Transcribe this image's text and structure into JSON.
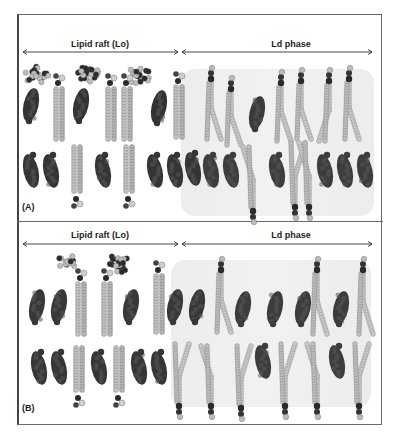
{
  "figure": {
    "panels": [
      {
        "id": "A",
        "tag": "(A)",
        "regions": [
          {
            "label": "Lipid raft (Lo)",
            "x_start": 0,
            "x_end": 160
          },
          {
            "label": "Ld phase",
            "x_end": 353,
            "x_start": 162
          }
        ]
      },
      {
        "id": "B",
        "tag": "(B)",
        "regions": [
          {
            "label": "Lipid raft (Lo)",
            "x_start": 0,
            "x_end": 160
          },
          {
            "label": "Ld phase",
            "x_start": 162,
            "x_end": 353
          }
        ]
      }
    ],
    "legend_colors": {
      "cholesterol": "#3a3a3a",
      "saturated_lipid_tail": "#b8b8b8",
      "unsaturated_lipid_tail": "#c4c4c4",
      "headgroup_dark": "#2a2a2a",
      "ld_phase_background": "#eeeeee",
      "frame_border": "#6a6a6a"
    }
  }
}
